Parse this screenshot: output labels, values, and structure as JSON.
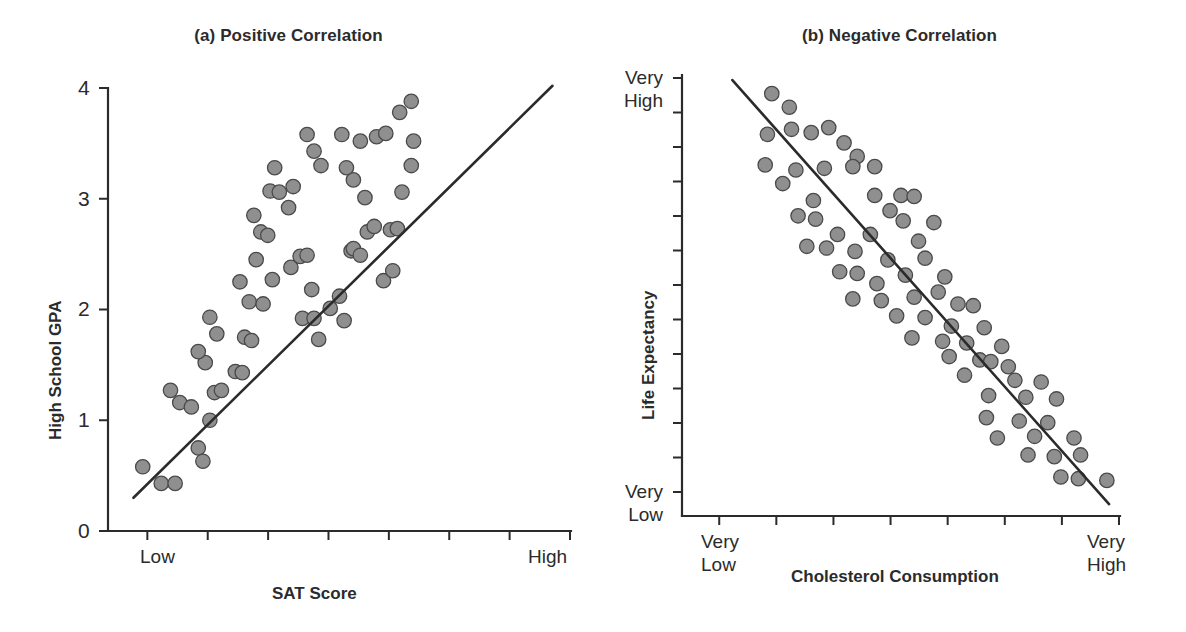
{
  "figure": {
    "background": "#ffffff",
    "dot_fill": "#8f8f8f",
    "dot_stroke": "#4a4a4a",
    "line_color": "#2b2b2b"
  },
  "panels": [
    {
      "id": "a",
      "title": "(a) Positive Correlation",
      "ylabel": "High School GPA",
      "xlabel": "SAT Score",
      "y_tick_labels": [
        "4",
        "3",
        "2",
        "1",
        "0"
      ],
      "x_tick_labels": {
        "left": "Low",
        "right": "High"
      }
    },
    {
      "id": "b",
      "title": "(b) Negative Correlation",
      "ylabel": "Life Expectancy",
      "xlabel": "Cholesterol Consumption",
      "y_tick_labels": {
        "top": "Very\nHigh",
        "bottom": "Very\nLow"
      },
      "x_tick_labels": {
        "left": "Very\nLow",
        "right": "Very\nHigh"
      }
    }
  ],
  "chart_data": [
    {
      "type": "scatter",
      "title": "(a) Positive Correlation",
      "xlabel": "SAT Score",
      "ylabel": "High School GPA",
      "xlim": [
        0,
        10
      ],
      "ylim": [
        0,
        4
      ],
      "x_tick_labels": [
        "Low",
        "",
        "",
        "",
        "",
        "",
        "",
        "High"
      ],
      "y_ticks": [
        0,
        1,
        2,
        3,
        4
      ],
      "grid": false,
      "legend": null,
      "trendline": {
        "x": [
          0.55,
          9.6
        ],
        "y": [
          0.3,
          4.02
        ]
      },
      "n_points": 66,
      "points": [
        [
          0.75,
          0.58
        ],
        [
          1.15,
          0.43
        ],
        [
          1.45,
          0.43
        ],
        [
          1.35,
          1.27
        ],
        [
          1.55,
          1.16
        ],
        [
          1.8,
          1.12
        ],
        [
          1.95,
          0.75
        ],
        [
          2.05,
          0.63
        ],
        [
          2.2,
          1.0
        ],
        [
          2.1,
          1.52
        ],
        [
          1.95,
          1.62
        ],
        [
          2.3,
          1.25
        ],
        [
          2.45,
          1.27
        ],
        [
          2.35,
          1.78
        ],
        [
          2.2,
          1.93
        ],
        [
          2.75,
          1.44
        ],
        [
          2.9,
          1.43
        ],
        [
          2.95,
          1.75
        ],
        [
          3.1,
          1.72
        ],
        [
          3.05,
          2.07
        ],
        [
          2.85,
          2.25
        ],
        [
          3.35,
          2.05
        ],
        [
          3.2,
          2.45
        ],
        [
          3.3,
          2.7
        ],
        [
          3.15,
          2.85
        ],
        [
          3.55,
          2.27
        ],
        [
          3.45,
          2.67
        ],
        [
          3.5,
          3.07
        ],
        [
          3.7,
          3.06
        ],
        [
          3.6,
          3.28
        ],
        [
          3.95,
          2.38
        ],
        [
          3.9,
          2.92
        ],
        [
          4.0,
          3.11
        ],
        [
          4.2,
          1.92
        ],
        [
          4.15,
          2.48
        ],
        [
          4.3,
          2.49
        ],
        [
          4.45,
          1.92
        ],
        [
          4.4,
          2.18
        ],
        [
          4.55,
          1.73
        ],
        [
          4.6,
          3.3
        ],
        [
          4.45,
          3.43
        ],
        [
          4.3,
          3.58
        ],
        [
          4.8,
          2.01
        ],
        [
          5.0,
          2.12
        ],
        [
          5.1,
          1.9
        ],
        [
          5.25,
          2.53
        ],
        [
          5.3,
          2.55
        ],
        [
          5.45,
          2.49
        ],
        [
          5.6,
          2.7
        ],
        [
          5.75,
          2.75
        ],
        [
          5.55,
          3.01
        ],
        [
          5.3,
          3.17
        ],
        [
          5.15,
          3.28
        ],
        [
          5.05,
          3.58
        ],
        [
          5.45,
          3.52
        ],
        [
          5.8,
          3.56
        ],
        [
          6.0,
          3.59
        ],
        [
          6.3,
          3.78
        ],
        [
          6.55,
          3.88
        ],
        [
          6.6,
          3.52
        ],
        [
          6.55,
          3.3
        ],
        [
          6.35,
          3.06
        ],
        [
          6.1,
          2.72
        ],
        [
          6.25,
          2.73
        ],
        [
          5.95,
          2.26
        ],
        [
          6.15,
          2.35
        ]
      ]
    },
    {
      "type": "scatter",
      "title": "(b) Negative Correlation",
      "xlabel": "Cholesterol Consumption",
      "ylabel": "Life Expectancy",
      "xlim": [
        0,
        10
      ],
      "ylim": [
        0,
        13
      ],
      "x_tick_labels": [
        "Very Low",
        "",
        "",
        "",
        "",
        "",
        "",
        "Very High"
      ],
      "y_tick_labels": [
        "Very High",
        "",
        "",
        "",
        "",
        "",
        "",
        "",
        "",
        "",
        "",
        "",
        "Very Low"
      ],
      "grid": false,
      "legend": null,
      "trendline": {
        "x": [
          1.15,
          9.75
        ],
        "y": [
          12.85,
          0.35
        ]
      },
      "n_points": 72,
      "points": [
        [
          2.05,
          12.45
        ],
        [
          2.45,
          12.05
        ],
        [
          2.5,
          11.4
        ],
        [
          2.95,
          11.3
        ],
        [
          3.35,
          11.45
        ],
        [
          1.95,
          11.25
        ],
        [
          3.7,
          11.0
        ],
        [
          4.0,
          10.6
        ],
        [
          1.9,
          10.35
        ],
        [
          2.6,
          10.2
        ],
        [
          3.25,
          10.25
        ],
        [
          3.9,
          10.3
        ],
        [
          4.4,
          10.3
        ],
        [
          2.3,
          9.8
        ],
        [
          4.4,
          9.45
        ],
        [
          5.0,
          9.45
        ],
        [
          5.3,
          9.42
        ],
        [
          3.0,
          9.3
        ],
        [
          4.75,
          9.0
        ],
        [
          2.65,
          8.85
        ],
        [
          3.05,
          8.75
        ],
        [
          5.05,
          8.7
        ],
        [
          5.75,
          8.65
        ],
        [
          3.55,
          8.3
        ],
        [
          4.3,
          8.3
        ],
        [
          5.4,
          8.1
        ],
        [
          2.85,
          7.95
        ],
        [
          3.3,
          7.9
        ],
        [
          3.95,
          7.8
        ],
        [
          4.7,
          7.55
        ],
        [
          5.55,
          7.6
        ],
        [
          3.6,
          7.2
        ],
        [
          4.0,
          7.15
        ],
        [
          5.1,
          7.1
        ],
        [
          6.0,
          7.05
        ],
        [
          4.45,
          6.85
        ],
        [
          5.85,
          6.6
        ],
        [
          3.9,
          6.4
        ],
        [
          4.55,
          6.35
        ],
        [
          5.3,
          6.45
        ],
        [
          6.3,
          6.25
        ],
        [
          6.65,
          6.2
        ],
        [
          4.9,
          5.9
        ],
        [
          5.55,
          5.85
        ],
        [
          6.15,
          5.6
        ],
        [
          6.9,
          5.55
        ],
        [
          5.25,
          5.25
        ],
        [
          5.95,
          5.15
        ],
        [
          6.5,
          5.1
        ],
        [
          7.3,
          5.0
        ],
        [
          6.1,
          4.7
        ],
        [
          6.8,
          4.6
        ],
        [
          7.05,
          4.55
        ],
        [
          7.45,
          4.4
        ],
        [
          6.45,
          4.15
        ],
        [
          7.6,
          4.0
        ],
        [
          8.2,
          3.95
        ],
        [
          7.0,
          3.55
        ],
        [
          7.85,
          3.5
        ],
        [
          8.55,
          3.45
        ],
        [
          6.95,
          2.9
        ],
        [
          7.7,
          2.8
        ],
        [
          8.35,
          2.75
        ],
        [
          7.2,
          2.3
        ],
        [
          8.05,
          2.35
        ],
        [
          8.95,
          2.3
        ],
        [
          7.9,
          1.8
        ],
        [
          8.5,
          1.75
        ],
        [
          9.1,
          1.8
        ],
        [
          8.65,
          1.15
        ],
        [
          9.05,
          1.1
        ],
        [
          9.7,
          1.05
        ]
      ]
    }
  ]
}
